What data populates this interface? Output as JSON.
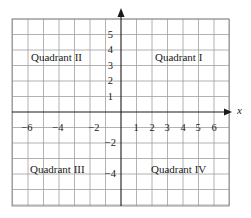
{
  "diagram": {
    "type": "cartesian-coordinate-plane",
    "colors": {
      "grid": "#9a9a9a",
      "axis": "#1a1a1a",
      "text": "#1a1a1a",
      "background": "#ffffff"
    },
    "axes": {
      "x_label": "x",
      "x_range": [
        -7,
        7
      ],
      "y_range": [
        -6,
        6
      ]
    },
    "x_ticks": [
      {
        "value": -6,
        "label": "−6"
      },
      {
        "value": -4,
        "label": "−4"
      },
      {
        "value": -2,
        "label": "−2"
      },
      {
        "value": 1,
        "label": "1"
      },
      {
        "value": 2,
        "label": "2"
      },
      {
        "value": 3,
        "label": "3"
      },
      {
        "value": 4,
        "label": "4"
      },
      {
        "value": 5,
        "label": "5"
      },
      {
        "value": 6,
        "label": "6"
      }
    ],
    "y_ticks": [
      {
        "value": 5,
        "label": "5"
      },
      {
        "value": 4,
        "label": "4"
      },
      {
        "value": 3,
        "label": "3"
      },
      {
        "value": 2,
        "label": "2"
      },
      {
        "value": 1,
        "label": "1"
      },
      {
        "value": -2,
        "label": "−2"
      },
      {
        "value": -4,
        "label": "−4"
      }
    ],
    "quadrants": [
      {
        "id": "I",
        "label": "Quadrant I"
      },
      {
        "id": "II",
        "label": "Quadrant II"
      },
      {
        "id": "III",
        "label": "Quadrant III"
      },
      {
        "id": "IV",
        "label": "Quadrant IV"
      }
    ]
  }
}
